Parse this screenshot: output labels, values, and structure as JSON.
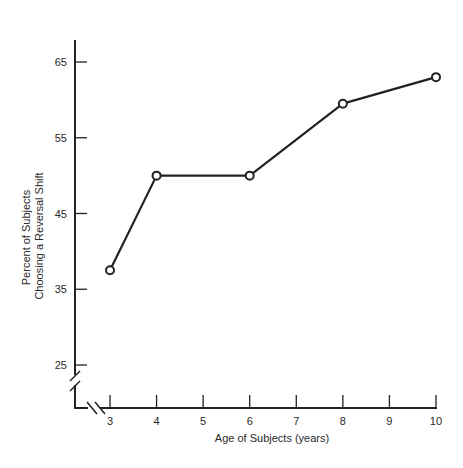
{
  "chart_data": {
    "type": "line",
    "title": "",
    "xlabel": "Age of Subjects (years)",
    "ylabel": [
      "Percent of Subjects",
      "Choosing a Reversal Shift"
    ],
    "x": [
      3,
      4,
      6,
      8,
      10
    ],
    "values": [
      37.5,
      50,
      50,
      59.5,
      63
    ],
    "series": [
      {
        "name": "Reversal shift",
        "x": [
          3,
          4,
          6,
          8,
          10
        ],
        "values": [
          37.5,
          50,
          50,
          59.5,
          63
        ],
        "marker": "open-circle"
      }
    ],
    "x_ticks": [
      3,
      4,
      5,
      6,
      7,
      8,
      9,
      10
    ],
    "y_ticks": [
      25,
      35,
      45,
      55,
      65
    ],
    "xlim": [
      2.2,
      10
    ],
    "ylim": [
      20,
      70
    ],
    "axis_breaks": {
      "x": true,
      "y": true
    },
    "grid": false,
    "legend": null
  },
  "colors": {
    "line": "#222222",
    "marker_fill": "#ffffff",
    "axis": "#222222"
  }
}
